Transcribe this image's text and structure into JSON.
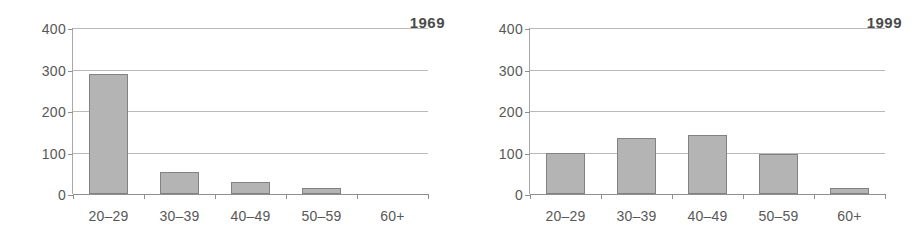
{
  "chart_data": [
    {
      "type": "bar",
      "title": "1969",
      "categories": [
        "20–29",
        "30–39",
        "40–49",
        "50–59",
        "60+"
      ],
      "values": [
        290,
        53,
        30,
        15,
        0
      ],
      "xlabel": "",
      "ylabel": "",
      "ylim": [
        0,
        400
      ],
      "yticks": [
        0,
        100,
        200,
        300,
        400
      ],
      "ytick_labels": [
        "0",
        "100",
        "200",
        "300",
        "400"
      ],
      "grid": true,
      "legend": "none",
      "bar_color": "#b4b4b4",
      "bar_border_color": "#828282"
    },
    {
      "type": "bar",
      "title": "1999",
      "categories": [
        "20–29",
        "30–39",
        "40–49",
        "50–59",
        "60+"
      ],
      "values": [
        100,
        136,
        143,
        97,
        15
      ],
      "xlabel": "",
      "ylabel": "",
      "ylim": [
        0,
        400
      ],
      "yticks": [
        0,
        100,
        200,
        300,
        400
      ],
      "ytick_labels": [
        "0",
        "100",
        "200",
        "300",
        "400"
      ],
      "grid": true,
      "legend": "none",
      "bar_color": "#b4b4b4",
      "bar_border_color": "#828282"
    }
  ]
}
